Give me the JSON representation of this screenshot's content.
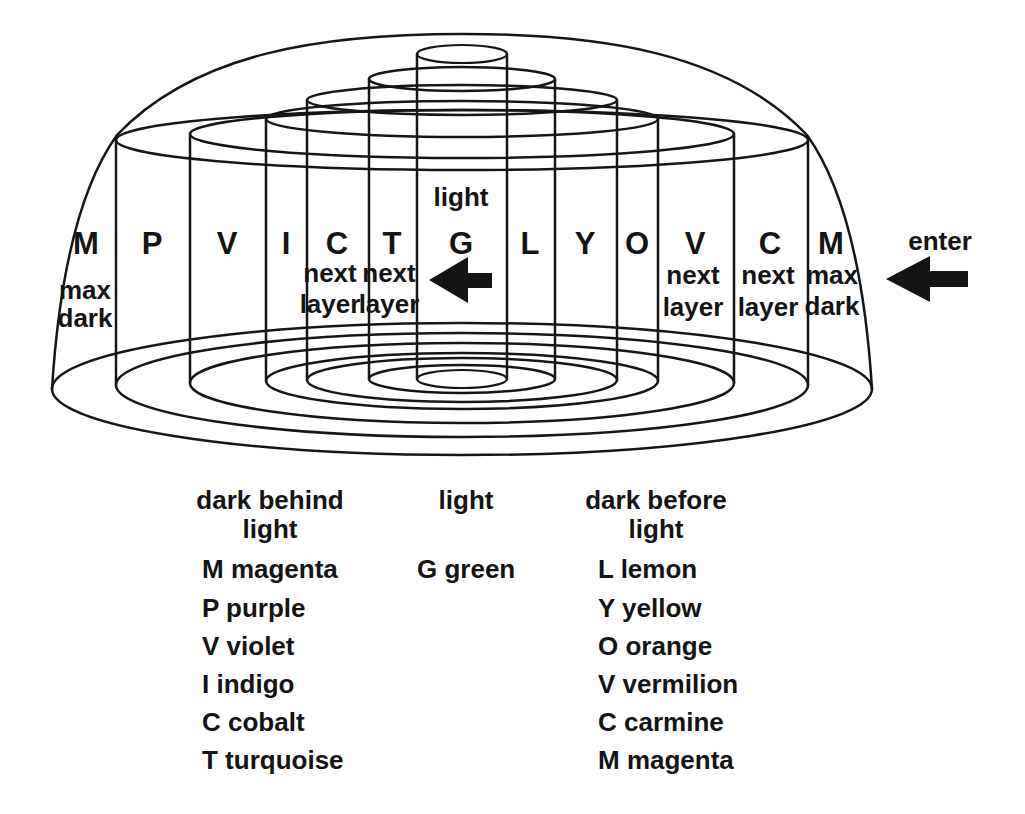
{
  "diagram": {
    "column_letters": [
      "M",
      "P",
      "V",
      "I",
      "C",
      "T",
      "G",
      "L",
      "Y",
      "O",
      "V",
      "C",
      "M"
    ],
    "annotations": {
      "light": "light",
      "next": "next",
      "layer": "layer",
      "max": "max",
      "dark": "dark",
      "enter": "enter"
    }
  },
  "legend": {
    "left": {
      "header": [
        "dark behind",
        "light"
      ],
      "items": [
        "M magenta",
        "P purple",
        "V violet",
        "I indigo",
        "C cobalt",
        "T turquoise"
      ]
    },
    "middle": {
      "header": [
        "light"
      ],
      "items": [
        "G green"
      ]
    },
    "right": {
      "header": [
        "dark before",
        "light"
      ],
      "items": [
        "L lemon",
        "Y yellow",
        "O orange",
        "V vermilion",
        "C carmine",
        "M magenta"
      ]
    }
  },
  "colors": {
    "ink": "#161616",
    "background": "#ffffff"
  }
}
